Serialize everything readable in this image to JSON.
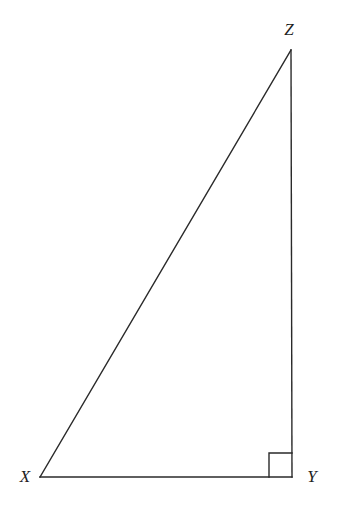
{
  "figure": {
    "kind": "geometry-diagram",
    "shape": "right-triangle",
    "background_color": "#ffffff",
    "stroke_color": "#2a2a2a",
    "label_color": "#1f1f1f",
    "canvas": {
      "width": 337,
      "height": 512
    },
    "vertices": [
      {
        "name": "X",
        "label": "X",
        "x": 40,
        "y": 477
      },
      {
        "name": "Y",
        "label": "Y",
        "x": 292,
        "y": 477
      },
      {
        "name": "Z",
        "label": "Z",
        "x": 291,
        "y": 50
      }
    ],
    "labels": [
      {
        "key": "Z",
        "text": "Z",
        "x": 289,
        "y": 29
      },
      {
        "key": "X",
        "text": "X",
        "x": 25,
        "y": 476
      },
      {
        "key": "Y",
        "text": "Y",
        "x": 312,
        "y": 476
      }
    ],
    "sides": [
      {
        "name": "XY",
        "from": "X",
        "to": "Y",
        "role": "base"
      },
      {
        "name": "YZ",
        "from": "Y",
        "to": "Z",
        "role": "vertical-leg"
      },
      {
        "name": "XZ",
        "from": "X",
        "to": "Z",
        "role": "hypotenuse"
      }
    ],
    "right_angle": {
      "at_vertex": "Y",
      "marker": "square",
      "size": 24,
      "x": 269,
      "y": 453
    },
    "polygon_points": "40,477 292,477 291,50",
    "right_angle_points": "269,453 292,453 292,477 269,477"
  }
}
